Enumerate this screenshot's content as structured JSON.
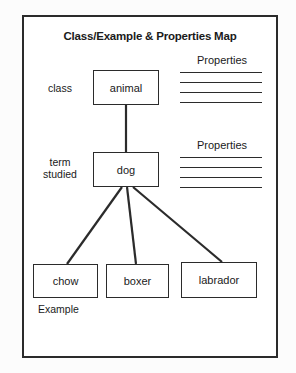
{
  "document": {
    "title": "Class/Example & Properties Map"
  },
  "diagram": {
    "type": "concept-map",
    "levels": [
      {
        "role_label": "class",
        "nodes": [
          "animal"
        ]
      },
      {
        "role_label": "term\nstudied",
        "nodes": [
          "dog"
        ]
      },
      {
        "role_label": "Example",
        "nodes": [
          "chow",
          "boxer",
          "labrador"
        ]
      }
    ],
    "labels": {
      "class": "class",
      "term_studied_line1": "term",
      "term_studied_line2": "studied",
      "example": "Example"
    },
    "nodes": {
      "animal": "animal",
      "dog": "dog",
      "chow": "chow",
      "boxer": "boxer",
      "labrador": "labrador"
    },
    "edges": [
      {
        "from": "animal",
        "to": "dog"
      },
      {
        "from": "dog",
        "to": "chow"
      },
      {
        "from": "dog",
        "to": "boxer"
      },
      {
        "from": "dog",
        "to": "labrador"
      }
    ]
  },
  "properties_blocks": [
    {
      "heading": "Properties",
      "line_count": 4
    },
    {
      "heading": "Properties",
      "line_count": 4
    }
  ],
  "colors": {
    "ink": "#2b2b2b",
    "text": "#1a1a1a",
    "paper": "#ffffff"
  }
}
